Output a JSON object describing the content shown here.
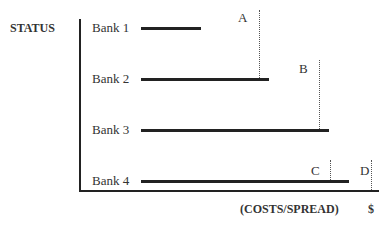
{
  "diagram": {
    "y_axis_label": "STATUS",
    "x_axis_label": "(COSTS/SPREAD)",
    "x_axis_unit": "$",
    "banks": [
      {
        "label": "Bank 1",
        "bar_start": 141,
        "bar_end": 201,
        "y": 27
      },
      {
        "label": "Bank 2",
        "bar_start": 141,
        "bar_end": 269,
        "y": 78
      },
      {
        "label": "Bank 3",
        "bar_start": 141,
        "bar_end": 329,
        "y": 129
      },
      {
        "label": "Bank 4",
        "bar_start": 141,
        "bar_end": 349,
        "y": 180
      }
    ],
    "markers": [
      {
        "label": "A",
        "x": 259,
        "top": 10,
        "bottom": 78
      },
      {
        "label": "B",
        "x": 319,
        "top": 60,
        "bottom": 129
      },
      {
        "label": "C",
        "x": 330,
        "top": 160,
        "bottom": 180
      },
      {
        "label": "D",
        "x": 371,
        "top": 160,
        "bottom": 190
      }
    ],
    "colors": {
      "line": "#222222",
      "text": "#333333",
      "background": "#ffffff"
    }
  }
}
